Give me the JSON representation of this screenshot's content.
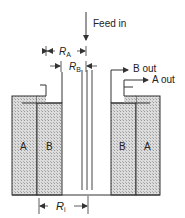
{
  "diagram": {
    "type": "annular-separator-schematic",
    "labels": {
      "feed_in": "Feed in",
      "b_out": "B out",
      "a_out": "A out",
      "left_outer_region": "A",
      "left_inner_region": "B",
      "right_inner_region": "B",
      "right_outer_region": "A"
    },
    "dimensions": {
      "ra": {
        "symbol": "R",
        "subscript": "A"
      },
      "rb": {
        "symbol": "R",
        "subscript": "B"
      },
      "ri": {
        "symbol": "R",
        "subscript": "i"
      }
    },
    "colors": {
      "line": "#333333",
      "hatch_fill": "#d9d9d9",
      "hatch_dot": "#9a9a9a",
      "background": "#ffffff"
    }
  }
}
